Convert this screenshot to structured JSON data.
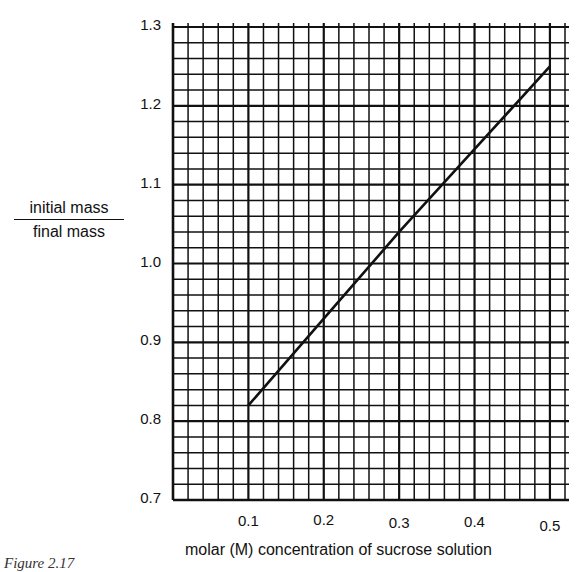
{
  "chart_data": {
    "type": "line",
    "title": "",
    "xlabel": "molar (M) concentration of sucrose solution",
    "ylabel_numerator": "initial mass",
    "ylabel_denominator": "final mass",
    "x_ticks": [
      "0.1",
      "0.2",
      "0.3",
      "0.4",
      "0.5"
    ],
    "y_ticks": [
      "1.3",
      "1.2",
      "1.1",
      "1.0",
      "0.9",
      "0.8",
      "0.7"
    ],
    "xlim": [
      0.0,
      0.52
    ],
    "ylim": [
      0.7,
      1.3
    ],
    "grid": true,
    "grid_minor_x_step": 0.02,
    "grid_minor_y_step": 0.02,
    "series": [
      {
        "name": "initial mass / final mass",
        "x": [
          0.1,
          0.2,
          0.3,
          0.4,
          0.5
        ],
        "values": [
          0.82,
          0.93,
          1.04,
          1.145,
          1.25
        ]
      }
    ],
    "legend": "none"
  },
  "caption": "Figure 2.17",
  "colors": {
    "grid": "#111111",
    "line": "#111111",
    "background": "#ffffff"
  }
}
